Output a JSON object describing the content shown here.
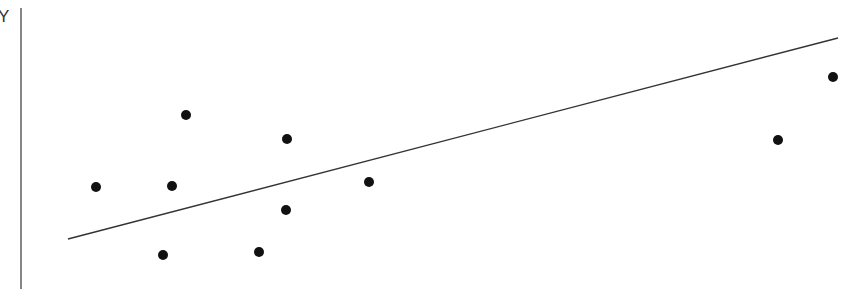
{
  "chart_data": {
    "type": "scatter",
    "title": "",
    "xlabel": "",
    "ylabel": "Y",
    "grid": false,
    "legend": null,
    "points_px": [
      {
        "x": 96,
        "y": 187
      },
      {
        "x": 172,
        "y": 186
      },
      {
        "x": 186,
        "y": 115
      },
      {
        "x": 163,
        "y": 255
      },
      {
        "x": 259,
        "y": 252
      },
      {
        "x": 286,
        "y": 210
      },
      {
        "x": 287,
        "y": 139
      },
      {
        "x": 369,
        "y": 182
      },
      {
        "x": 778,
        "y": 140
      },
      {
        "x": 833,
        "y": 77
      }
    ],
    "trendline_px": {
      "x1": 68,
      "y1": 239,
      "x2": 838,
      "y2": 38
    },
    "axis_px": {
      "x": 21,
      "y1": 8,
      "y2": 289
    },
    "colors": {
      "point": "#111111",
      "line": "#333333",
      "axis": "#444444"
    }
  }
}
